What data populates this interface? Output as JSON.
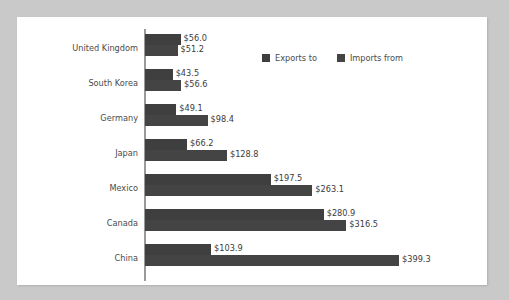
{
  "chart_data": {
    "type": "bar",
    "orientation": "horizontal",
    "title": "",
    "xlabel": "",
    "ylabel": "",
    "grid": false,
    "legend_position": "top-right",
    "categories": [
      "United Kingdom",
      "South Korea",
      "Germany",
      "Japan",
      "Mexico",
      "Canada",
      "China"
    ],
    "series": [
      {
        "name": "Exports to",
        "color": "#3f3f3f",
        "values": [
          56.0,
          43.5,
          49.1,
          66.2,
          197.5,
          280.9,
          103.9
        ],
        "labels": [
          "$56.0",
          "$43.5",
          "$49.1",
          "$66.2",
          "$197.5",
          "$280.9",
          "$103.9"
        ]
      },
      {
        "name": "Imports from",
        "color": "#444444",
        "values": [
          51.2,
          56.6,
          98.4,
          128.8,
          263.1,
          316.5,
          399.3
        ],
        "labels": [
          "$51.2",
          "$56.6",
          "$98.4",
          "$128.8",
          "$263.1",
          "$316.5",
          "$399.3"
        ]
      }
    ],
    "xlim": [
      0,
      399.3
    ],
    "value_prefix": "$",
    "value_unit": "billions"
  },
  "legend": {
    "entries": [
      {
        "label": "Exports to",
        "swatch": "exports-swatch"
      },
      {
        "label": "Imports from",
        "swatch": "imports-swatch"
      }
    ]
  },
  "colors": {
    "page_background": "#c9c9c9",
    "card_background": "#ffffff",
    "axis": "#9a9a9a",
    "text": "#4a4a4a",
    "series_exports": "#3f3f3f",
    "series_imports": "#444444"
  }
}
